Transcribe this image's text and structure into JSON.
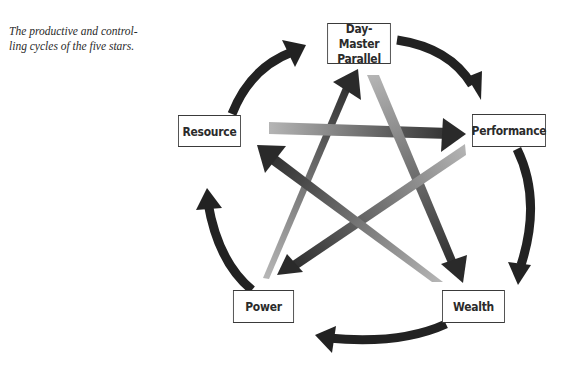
{
  "caption": "The productive and controlling cycles of the five stars.",
  "caption_lines": [
    "The productive and control-",
    "ling cycles of the five stars."
  ],
  "nodes": {
    "day_master": {
      "line1": "Day-Master",
      "line2": "Parallel"
    },
    "performance": {
      "label": "Performance"
    },
    "wealth": {
      "label": "Wealth"
    },
    "power": {
      "label": "Power"
    },
    "resource": {
      "label": "Resource"
    }
  },
  "cycles": {
    "productive": [
      "Day-Master Parallel",
      "Performance",
      "Wealth",
      "Power",
      "Resource",
      "Day-Master Parallel"
    ],
    "controlling": [
      {
        "from": "Resource",
        "to": "Performance"
      },
      {
        "from": "Day-Master Parallel",
        "to": "Wealth"
      },
      {
        "from": "Performance",
        "to": "Power"
      },
      {
        "from": "Wealth",
        "to": "Resource"
      },
      {
        "from": "Power",
        "to": "Day-Master Parallel"
      }
    ]
  },
  "colors": {
    "arrow_dark": "#222222",
    "arrow_light": "#b3b3b3",
    "box_border": "#3a3a3a",
    "text": "#2b2b2b"
  }
}
